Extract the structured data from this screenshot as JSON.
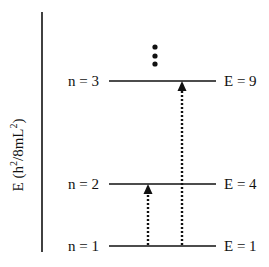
{
  "diagram": {
    "y_axis_label_main": "E (h",
    "y_axis_label_sup1": "2",
    "y_axis_label_mid": "/8mL",
    "y_axis_label_sup2": "2",
    "y_axis_label_end": ")",
    "y_axis_label_full": "E (h²/8mL²)",
    "levels": [
      {
        "n_label": "n = 3",
        "e_label": "E = 9",
        "y": 81
      },
      {
        "n_label": "n = 2",
        "e_label": "E = 4",
        "y": 184
      },
      {
        "n_label": "n = 1",
        "e_label": "E = 1",
        "y": 246
      }
    ],
    "transitions": [
      {
        "from": "n = 1",
        "to": "n = 2",
        "style": "dotted arrow"
      },
      {
        "from": "n = 1",
        "to": "n = 3",
        "style": "dotted arrow"
      }
    ],
    "continuation": "vertical ellipsis (more levels above)",
    "colors": {
      "line": "#111111",
      "background": "#ffffff"
    }
  }
}
